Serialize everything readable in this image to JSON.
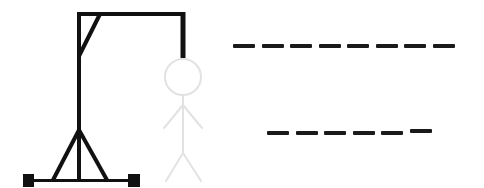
{
  "game": {
    "name": "Hangman",
    "wrong_guesses_shown": 0,
    "gallows": {
      "color": "#111111"
    },
    "figure": {
      "color": "#e2e2e2",
      "parts": [
        "head",
        "body",
        "left-arm",
        "right-arm",
        "left-leg",
        "right-leg"
      ],
      "state": "faded-placeholder"
    },
    "words": [
      {
        "length": 8,
        "letters": [
          "",
          "",
          "",
          "",
          "",
          "",
          "",
          ""
        ]
      },
      {
        "length": 6,
        "letters": [
          "",
          "",
          "",
          "",
          "",
          ""
        ]
      }
    ]
  }
}
